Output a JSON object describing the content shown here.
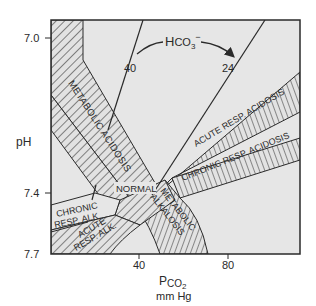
{
  "diagram": {
    "colors": {
      "plot_bg": "#e6e6e6",
      "band_fill": "#e2e2e2",
      "line": "#2a2a2a",
      "text": "#2a2a2a"
    },
    "y_axis": {
      "label": "pH",
      "ticks": [
        {
          "label": "7.0",
          "y": 38
        },
        {
          "label": "7.4",
          "y": 193
        },
        {
          "label": "7.7",
          "y": 253
        }
      ]
    },
    "x_axis": {
      "label_main": "P",
      "label_sub": "CO",
      "label_sub2": "2",
      "unit": "mm Hg",
      "ticks": [
        {
          "label": "40",
          "x": 139
        },
        {
          "label": "80",
          "x": 228
        }
      ]
    },
    "isopleths": {
      "title_main": "H",
      "title_rest": "CO",
      "title_sub": "3",
      "title_sup": "−",
      "lines": [
        {
          "label": "40"
        },
        {
          "label": "24"
        }
      ]
    },
    "regions": [
      {
        "id": "metabolic-acidosis",
        "label": "METABOLIC ACIDOSIS"
      },
      {
        "id": "acute-resp-acidosis",
        "label": "ACUTE RESP. ACIDOSIS"
      },
      {
        "id": "chronic-resp-acidosis",
        "label": "CHRONIC RESP. ACIDOSIS"
      },
      {
        "id": "normal",
        "label": "NORMAL"
      },
      {
        "id": "metabolic-alkalosis",
        "label": "METABOLIC ALKALOSIS",
        "line1": "METABOLIC",
        "line2": "ALKALOSIS"
      },
      {
        "id": "chronic-resp-alk",
        "label": "CHRONIC RESP. ALK.",
        "line1": "CHRONIC",
        "line2": "RESP. ALK."
      },
      {
        "id": "acute-resp-alk",
        "label": "ACUTE RESP. ALK.",
        "line1": "ACUTE",
        "line2": "RESP. ALK."
      }
    ]
  }
}
